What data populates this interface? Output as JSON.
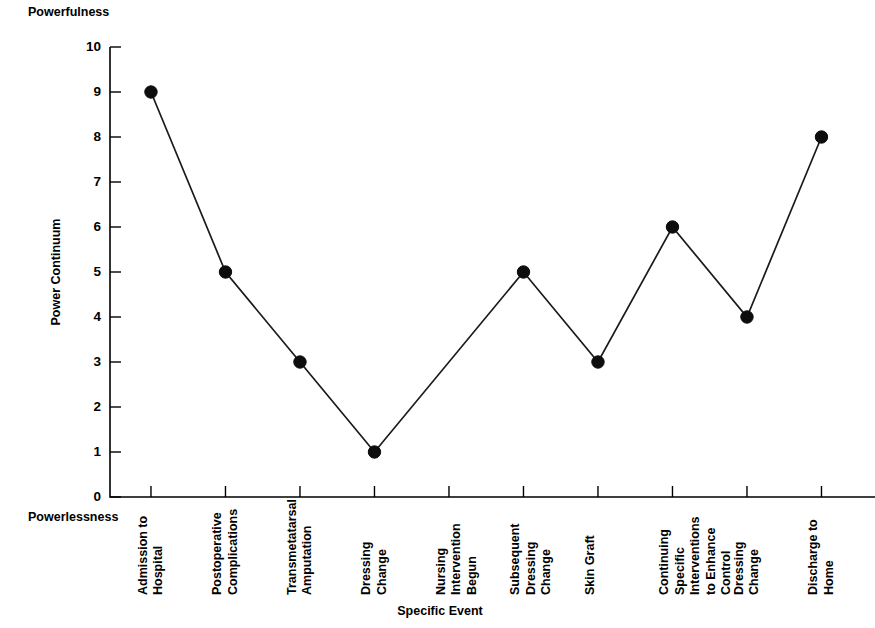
{
  "chart_data": {
    "type": "line",
    "title": "",
    "xlabel": "Specific Event",
    "ylabel": "Power Continuum",
    "top_anchor": "Powerfulness",
    "bottom_anchor": "Powerlessness",
    "ylim": [
      0,
      10
    ],
    "ytick_labels": [
      "0",
      "1",
      "2",
      "3",
      "4",
      "5",
      "6",
      "7",
      "8",
      "9",
      "10"
    ],
    "yticks": [
      0,
      1,
      2,
      3,
      4,
      5,
      6,
      7,
      8,
      9,
      10
    ],
    "grid": false,
    "legend": "none",
    "marker": "filled-circle",
    "line_color": "#1a1a1a",
    "categories": [
      "Admission to Hospital",
      "Postoperative Complications",
      "Transmetatarsal Amputation",
      "Dressing Change",
      "Nursing Intervention Begun",
      "Subsequent Dressing Change",
      "Skin Graft",
      "Continuing Specific Interventions to Enhance Control",
      "Dressing Change",
      "Discharge to Home"
    ],
    "category_lines": [
      [
        "Admission to",
        "Hospital"
      ],
      [
        "Postoperative",
        "Complications"
      ],
      [
        "Transmetatarsal",
        "Amputation"
      ],
      [
        "Dressing",
        "Change"
      ],
      [
        "Nursing",
        "Intervention",
        "Begun"
      ],
      [
        "Subsequent",
        "Dressing",
        "Change"
      ],
      [
        "Skin Graft"
      ],
      [
        "Continuing",
        "Specific",
        "Interventions",
        "to Enhance",
        "Control"
      ],
      [
        "Dressing",
        "Change"
      ],
      [
        "Discharge to",
        "Home"
      ]
    ],
    "values": [
      9,
      5,
      3,
      1,
      null,
      5,
      3,
      6,
      4,
      8
    ],
    "note": "No data marker is plotted at the 'Nursing Intervention Begun' tick; the line passes straight through it."
  }
}
